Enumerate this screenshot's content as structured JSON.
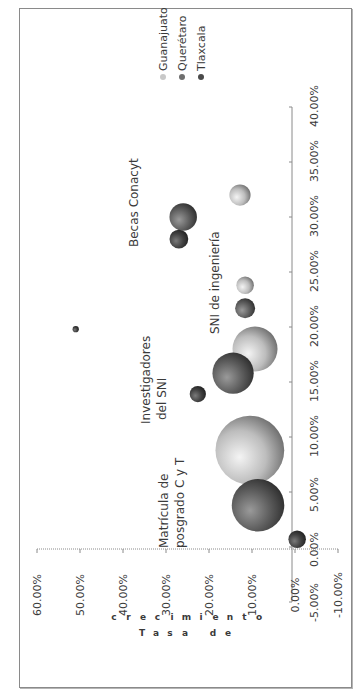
{
  "chart_data": {
    "type": "bubble",
    "orientation_note": "figure rotated 90 degrees counter-clockwise",
    "title": "",
    "xlabel": "",
    "ylabel": "Tasa de crecimiento",
    "xlim": [
      -5,
      40
    ],
    "ylim": [
      -10,
      60
    ],
    "x_ticks": [
      "-5.00%",
      "0.00%",
      "5.00%",
      "10.00%",
      "15.00%",
      "20.00%",
      "25.00%",
      "30.00%",
      "35.00%",
      "40.00%"
    ],
    "y_ticks": [
      "-10.00%",
      "0.00%",
      "10.00%",
      "20.00%",
      "30.00%",
      "40.00%",
      "50.00%",
      "60.00%"
    ],
    "legend": {
      "position": "top-right",
      "entries": [
        "Guanajuato",
        "Querétaro",
        "Tlaxcala"
      ]
    },
    "series": [
      {
        "name": "Guanajuato",
        "color": "#c8c8c8",
        "points": [
          {
            "x": 8.8,
            "y": 10.5,
            "size": 55
          },
          {
            "x": 18.0,
            "y": 9.3,
            "size": 36
          },
          {
            "x": 23.8,
            "y": 11.6,
            "size": 14
          },
          {
            "x": 32.0,
            "y": 12.8,
            "size": 17
          }
        ]
      },
      {
        "name": "Querétaro",
        "color": "#6e6e6e",
        "points": [
          {
            "x": 15.8,
            "y": 14.4,
            "size": 33
          },
          {
            "x": 21.7,
            "y": 11.6,
            "size": 16
          },
          {
            "x": 30.0,
            "y": 26.0,
            "size": 22
          },
          {
            "x": 3.8,
            "y": 8.6,
            "size": 42
          }
        ]
      },
      {
        "name": "Tlaxcala",
        "color": "#4a4a4a",
        "points": [
          {
            "x": 0.7,
            "y": -0.5,
            "size": 14
          },
          {
            "x": 13.9,
            "y": 22.6,
            "size": 13
          },
          {
            "x": 19.8,
            "y": 51.0,
            "size": 5
          },
          {
            "x": 28.0,
            "y": 27.0,
            "size": 15
          }
        ]
      }
    ],
    "annotations": [
      "Matrícula de posgrado C y T",
      "Investigadores del SNI",
      "SNI de ingeniería",
      "Becas Conacyt"
    ]
  },
  "labels": {
    "matricula_1": "Matrícula  de",
    "matricula_2": "posgrado  C y T",
    "investigadores_1": "Investigadores",
    "investigadores_2": "del SNI",
    "sni_ing": "SNI de ingeniería",
    "becas": "Becas Conacyt",
    "ylabel_row1": "c r e c i m i e n t o",
    "ylabel_row2": "T a s a   d e"
  }
}
